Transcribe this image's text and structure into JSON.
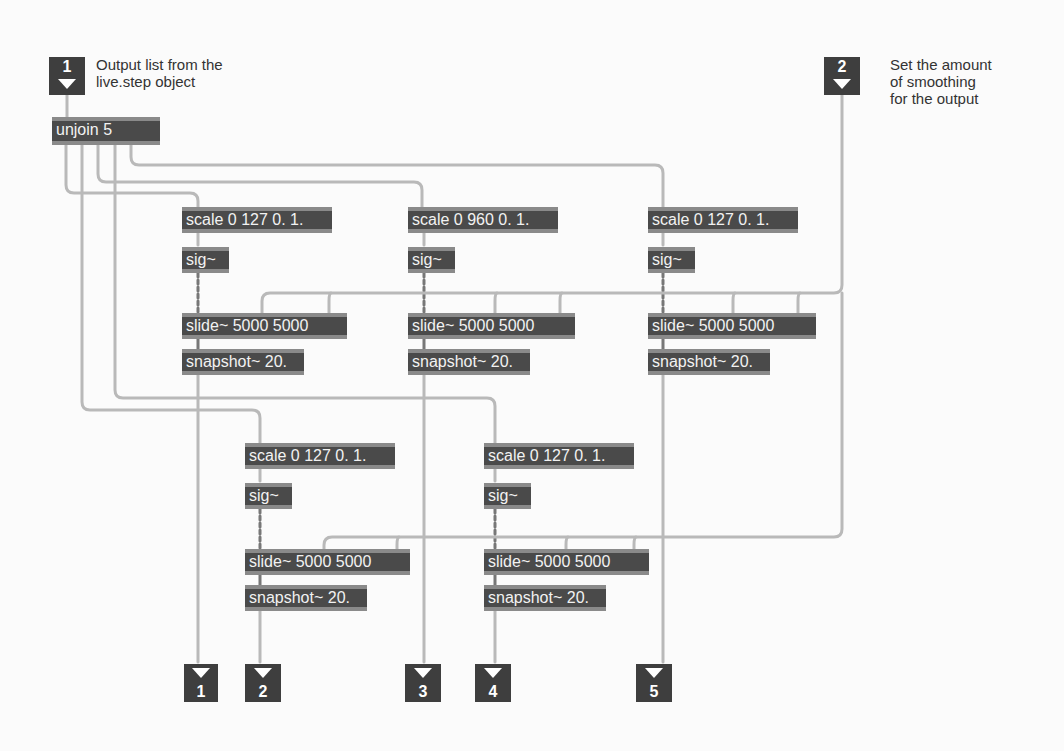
{
  "inlets": [
    {
      "number": "1",
      "comment": "Output list from the\nlive.step object"
    },
    {
      "number": "2",
      "comment": "Set the amount\nof smoothing\nfor the output"
    }
  ],
  "objects": {
    "unjoin": "unjoin 5",
    "chains": [
      {
        "scale": "scale 0 127 0. 1.",
        "sig": "sig~",
        "slide": "slide~ 5000 5000",
        "snapshot": "snapshot~ 20."
      },
      {
        "scale": "scale 0 960 0. 1.",
        "sig": "sig~",
        "slide": "slide~ 5000 5000",
        "snapshot": "snapshot~ 20."
      },
      {
        "scale": "scale 0 127 0. 1.",
        "sig": "sig~",
        "slide": "slide~ 5000 5000",
        "snapshot": "snapshot~ 20."
      },
      {
        "scale": "scale 0 127 0. 1.",
        "sig": "sig~",
        "slide": "slide~ 5000 5000",
        "snapshot": "snapshot~ 20."
      },
      {
        "scale": "scale 0 127 0. 1.",
        "sig": "sig~",
        "slide": "slide~ 5000 5000",
        "snapshot": "snapshot~ 20."
      }
    ]
  },
  "outlets": [
    {
      "number": "1"
    },
    {
      "number": "2"
    },
    {
      "number": "3"
    },
    {
      "number": "4"
    },
    {
      "number": "5"
    }
  ]
}
